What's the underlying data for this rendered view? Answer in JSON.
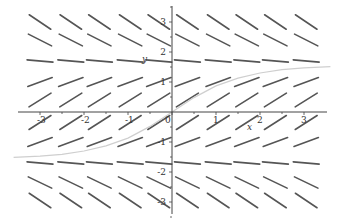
{
  "chart_data": {
    "type": "slope_field",
    "title": "",
    "xlabel": "x",
    "ylabel": "y",
    "xlim": [
      -3.4,
      3.9
    ],
    "ylim": [
      -3.7,
      3.7
    ],
    "grid": false,
    "legend": null,
    "x_ticks": [
      -3,
      -2,
      -1,
      0,
      1,
      2,
      3
    ],
    "x_tick_labels": [
      "-3",
      "-2",
      "-1",
      "0",
      "1",
      "2",
      "3"
    ],
    "y_ticks": [
      -3,
      -2,
      -1,
      1,
      2,
      3
    ],
    "y_tick_labels": [
      "-3",
      "-2",
      "-1",
      "1",
      "2",
      "3"
    ],
    "field": {
      "description": "Slope field dy/dx = cos(y); slopes independent of x",
      "grid_x": [
        -3.0,
        -2.3,
        -1.65,
        -0.95,
        -0.3,
        0.35,
        1.05,
        1.7,
        2.35,
        3.05
      ],
      "grid_y": [
        3.0,
        2.4,
        1.7,
        1.0,
        0.4,
        -0.35,
        -1.0,
        -1.7,
        -2.35,
        -2.95
      ],
      "segment_slopes_by_row": [
        -0.99,
        -0.74,
        -0.13,
        0.54,
        0.92,
        0.94,
        0.54,
        -0.13,
        -0.7,
        -0.98
      ]
    },
    "series": [
      {
        "name": "solution through origin",
        "color": "#cfcfcf",
        "x": [
          -3.6,
          -3.0,
          -2.5,
          -2.0,
          -1.5,
          -1.0,
          -0.5,
          0.0,
          0.5,
          1.0,
          1.5,
          2.0,
          2.5,
          3.0,
          3.6
        ],
        "y": [
          -1.51,
          -1.47,
          -1.41,
          -1.3,
          -1.13,
          -0.87,
          -0.48,
          0.0,
          0.48,
          0.87,
          1.13,
          1.3,
          1.41,
          1.47,
          1.51
        ]
      }
    ]
  },
  "colors": {
    "segment": "#555555",
    "axis": "#444444",
    "curve": "#cfcfcf"
  }
}
